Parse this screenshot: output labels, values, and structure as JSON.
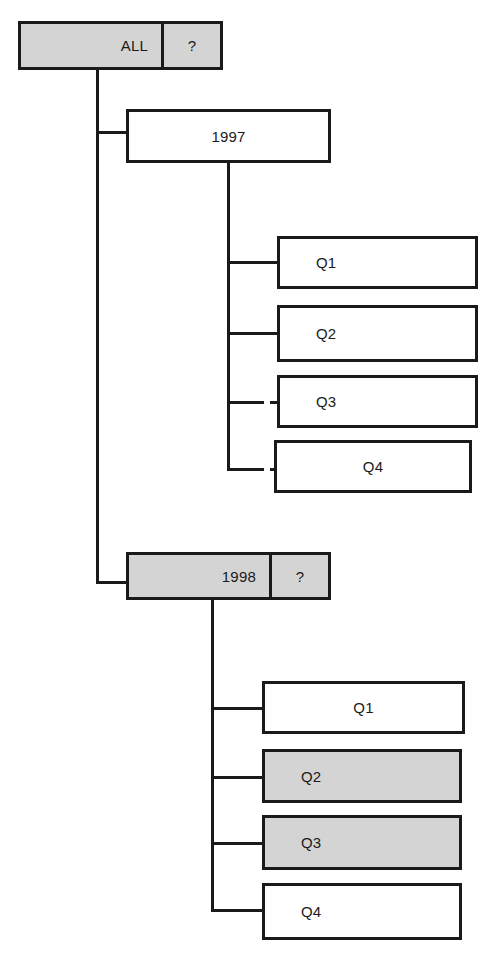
{
  "diagram": {
    "colors": {
      "line": "#1a1a1a",
      "shaded_fill": "#d4d4d4",
      "plain_fill": "#ffffff",
      "text": "#1b1b1b"
    },
    "nodes": [
      {
        "id": "all",
        "label": "ALL",
        "aux_label": "?",
        "has_aux": true,
        "shaded": true,
        "level": 0,
        "align": "right",
        "x": 18,
        "y": 21,
        "w": 205,
        "h": 49,
        "aux_w": 59
      },
      {
        "id": "y1997",
        "label": "1997",
        "aux_label": "",
        "has_aux": false,
        "shaded": false,
        "level": 1,
        "align": "center",
        "x": 126,
        "y": 109,
        "w": 205,
        "h": 54,
        "aux_w": 0
      },
      {
        "id": "y1997-q1",
        "label": "Q1",
        "aux_label": "",
        "has_aux": false,
        "shaded": false,
        "level": 2,
        "align": "left",
        "x": 277,
        "y": 236,
        "w": 201,
        "h": 53,
        "aux_w": 0
      },
      {
        "id": "y1997-q2",
        "label": "Q2",
        "aux_label": "",
        "has_aux": false,
        "shaded": false,
        "level": 2,
        "align": "left",
        "x": 277,
        "y": 305,
        "w": 201,
        "h": 57,
        "aux_w": 0
      },
      {
        "id": "y1997-q3",
        "label": "Q3",
        "aux_label": "",
        "has_aux": false,
        "shaded": false,
        "level": 2,
        "align": "left",
        "x": 277,
        "y": 375,
        "w": 201,
        "h": 53,
        "aux_w": 0
      },
      {
        "id": "y1997-q4",
        "label": "Q4",
        "aux_label": "",
        "has_aux": false,
        "shaded": false,
        "level": 2,
        "align": "center",
        "x": 274,
        "y": 440,
        "w": 198,
        "h": 53,
        "aux_w": 0
      },
      {
        "id": "y1998",
        "label": "1998",
        "aux_label": "?",
        "has_aux": true,
        "shaded": true,
        "level": 1,
        "align": "right",
        "x": 126,
        "y": 552,
        "w": 205,
        "h": 48,
        "aux_w": 59
      },
      {
        "id": "y1998-q1",
        "label": "Q1",
        "aux_label": "",
        "has_aux": false,
        "shaded": false,
        "level": 2,
        "align": "center",
        "x": 262,
        "y": 681,
        "w": 203,
        "h": 53,
        "aux_w": 0
      },
      {
        "id": "y1998-q2",
        "label": "Q2",
        "aux_label": "",
        "has_aux": false,
        "shaded": true,
        "level": 2,
        "align": "left",
        "x": 262,
        "y": 749,
        "w": 200,
        "h": 54,
        "aux_w": 0
      },
      {
        "id": "y1998-q3",
        "label": "Q3",
        "aux_label": "",
        "has_aux": false,
        "shaded": true,
        "level": 2,
        "align": "left",
        "x": 262,
        "y": 815,
        "w": 200,
        "h": 55,
        "aux_w": 0
      },
      {
        "id": "y1998-q4",
        "label": "Q4",
        "aux_label": "",
        "has_aux": false,
        "shaded": false,
        "level": 2,
        "align": "left",
        "x": 262,
        "y": 883,
        "w": 200,
        "h": 57,
        "aux_w": 0
      }
    ]
  }
}
